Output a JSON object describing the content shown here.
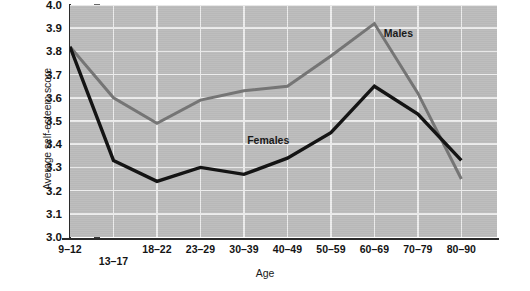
{
  "chart_data": {
    "type": "line",
    "title": "",
    "xlabel": "Age",
    "ylabel": "Average self-esteem score",
    "categories": [
      "9–12",
      "13–17",
      "18–22",
      "23–29",
      "30–39",
      "40–49",
      "50–59",
      "60–69",
      "70–79",
      "80–90"
    ],
    "ylim": [
      3.0,
      4.0
    ],
    "ytick_labels": [
      "3.0",
      "3.1",
      "3.2",
      "3.3",
      "3.4",
      "3.5",
      "3.6",
      "3.7",
      "3.8",
      "3.9",
      "4.0"
    ],
    "ytick_values": [
      3.0,
      3.1,
      3.2,
      3.3,
      3.4,
      3.5,
      3.6,
      3.7,
      3.8,
      3.9,
      4.0
    ],
    "grid": true,
    "legend_position": "inline-annotation",
    "series": [
      {
        "name": "Males",
        "color": "#757575",
        "values": [
          3.82,
          3.6,
          3.49,
          3.59,
          3.63,
          3.65,
          3.78,
          3.92,
          3.62,
          3.25
        ]
      },
      {
        "name": "Females",
        "color": "#141414",
        "values": [
          3.82,
          3.33,
          3.24,
          3.3,
          3.27,
          3.34,
          3.45,
          3.65,
          3.53,
          3.33
        ]
      }
    ],
    "annotations": [
      {
        "text": "Males",
        "x_frac": 0.735,
        "y_value": 3.875
      },
      {
        "text": "Females",
        "x_frac": 0.415,
        "y_value": 3.415
      }
    ],
    "plot_background": "#bcbcbc",
    "grid_color": "#ededed"
  }
}
